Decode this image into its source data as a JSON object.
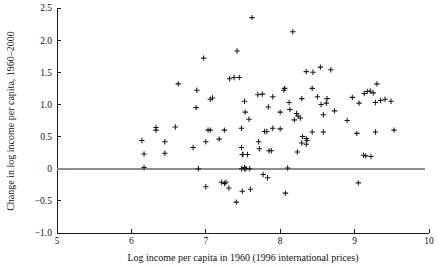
{
  "chart_data": {
    "type": "scatter",
    "title": "",
    "xlabel": "Log income per capita in 1960 (1996 international prices)",
    "ylabel": "Change in log income per capita, 1960–2000",
    "xlim": [
      5,
      10
    ],
    "ylim": [
      -1.0,
      2.5
    ],
    "xticks": [
      5,
      6,
      7,
      8,
      9,
      10
    ],
    "xtick_labels": [
      "5",
      "6",
      "7",
      "8",
      "9",
      "10"
    ],
    "yticks": [
      -1.0,
      -0.5,
      0,
      0.5,
      1.0,
      1.5,
      2.0,
      2.5
    ],
    "ytick_labels": [
      "−1.0",
      "−0.5",
      "0",
      "0.5",
      "1.0",
      "1.5",
      "2.0",
      "2.5"
    ],
    "grid": false,
    "legend": null,
    "marker": "plus",
    "marker_color": "#1a1a1a",
    "reference_lines": [
      {
        "name": "zero-line",
        "orientation": "horizontal",
        "y": 0,
        "color": "#8d8d8d"
      }
    ],
    "points": [
      [
        7.62,
        2.35
      ],
      [
        8.17,
        2.13
      ],
      [
        7.42,
        1.83
      ],
      [
        6.97,
        1.72
      ],
      [
        8.54,
        1.58
      ],
      [
        8.68,
        1.54
      ],
      [
        8.35,
        1.51
      ],
      [
        8.44,
        1.5
      ],
      [
        7.32,
        1.4
      ],
      [
        7.38,
        1.42
      ],
      [
        7.45,
        1.42
      ],
      [
        6.63,
        1.32
      ],
      [
        9.3,
        1.32
      ],
      [
        8.06,
        1.25
      ],
      [
        8.43,
        1.25
      ],
      [
        6.88,
        1.22
      ],
      [
        8.05,
        1.22
      ],
      [
        9.17,
        1.2
      ],
      [
        9.21,
        1.21
      ],
      [
        9.25,
        1.18
      ],
      [
        9.13,
        1.17
      ],
      [
        7.7,
        1.15
      ],
      [
        7.76,
        1.16
      ],
      [
        7.9,
        1.12
      ],
      [
        8.5,
        1.12
      ],
      [
        8.97,
        1.11
      ],
      [
        7.09,
        1.1
      ],
      [
        8.29,
        1.09
      ],
      [
        8.63,
        1.09
      ],
      [
        7.06,
        1.08
      ],
      [
        9.41,
        1.08
      ],
      [
        9.35,
        1.06
      ],
      [
        7.52,
        1.05
      ],
      [
        8.12,
        1.03
      ],
      [
        8.62,
        1.02
      ],
      [
        9.06,
        1.02
      ],
      [
        9.28,
        1.03
      ],
      [
        9.49,
        1.05
      ],
      [
        8.55,
        1.0
      ],
      [
        6.87,
        0.95
      ],
      [
        7.84,
        0.96
      ],
      [
        8.13,
        0.92
      ],
      [
        8.73,
        0.9
      ],
      [
        7.53,
        0.88
      ],
      [
        8.0,
        0.88
      ],
      [
        8.22,
        0.86
      ],
      [
        8.58,
        0.84
      ],
      [
        8.24,
        0.82
      ],
      [
        8.27,
        0.79
      ],
      [
        7.58,
        0.77
      ],
      [
        8.19,
        0.76
      ],
      [
        8.9,
        0.75
      ],
      [
        6.33,
        0.64
      ],
      [
        6.59,
        0.65
      ],
      [
        7.48,
        0.63
      ],
      [
        7.9,
        0.63
      ],
      [
        8.0,
        0.62
      ],
      [
        6.33,
        0.6
      ],
      [
        7.03,
        0.6
      ],
      [
        7.06,
        0.6
      ],
      [
        7.25,
        0.6
      ],
      [
        7.79,
        0.58
      ],
      [
        7.82,
        0.58
      ],
      [
        8.43,
        0.57
      ],
      [
        8.58,
        0.57
      ],
      [
        9.28,
        0.57
      ],
      [
        9.53,
        0.6
      ],
      [
        9.03,
        0.55
      ],
      [
        8.3,
        0.5
      ],
      [
        8.35,
        0.47
      ],
      [
        8.36,
        0.44
      ],
      [
        6.14,
        0.44
      ],
      [
        6.45,
        0.42
      ],
      [
        7.0,
        0.42
      ],
      [
        7.18,
        0.46
      ],
      [
        7.71,
        0.42
      ],
      [
        8.29,
        0.4
      ],
      [
        8.35,
        0.38
      ],
      [
        6.83,
        0.33
      ],
      [
        7.48,
        0.33
      ],
      [
        7.72,
        0.31
      ],
      [
        7.85,
        0.28
      ],
      [
        7.88,
        0.28
      ],
      [
        8.23,
        0.26
      ],
      [
        6.17,
        0.23
      ],
      [
        6.45,
        0.24
      ],
      [
        7.49,
        0.22
      ],
      [
        7.5,
        0.22
      ],
      [
        7.56,
        0.22
      ],
      [
        9.12,
        0.21
      ],
      [
        9.15,
        0.2
      ],
      [
        9.22,
        0.19
      ],
      [
        6.17,
        0.02
      ],
      [
        7.52,
        0.02
      ],
      [
        6.9,
        0.0
      ],
      [
        7.48,
        0.0
      ],
      [
        7.52,
        0.0
      ],
      [
        7.54,
        0.0
      ],
      [
        7.59,
        0.0
      ],
      [
        8.1,
        0.01
      ],
      [
        7.77,
        -0.09
      ],
      [
        7.83,
        -0.14
      ],
      [
        7.21,
        -0.21
      ],
      [
        7.25,
        -0.23
      ],
      [
        7.27,
        -0.21
      ],
      [
        9.05,
        -0.22
      ],
      [
        7.0,
        -0.28
      ],
      [
        7.31,
        -0.3
      ],
      [
        7.6,
        -0.32
      ],
      [
        7.49,
        -0.35
      ],
      [
        8.07,
        -0.38
      ],
      [
        7.41,
        -0.52
      ]
    ]
  },
  "figure": {
    "background": "#ffffff",
    "axis_color": "#1a1a1a",
    "marker_color": "#1a1a1a",
    "zero_line_color": "#8d8d8d"
  }
}
